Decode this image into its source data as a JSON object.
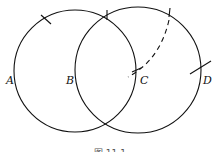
{
  "diagram": {
    "type": "geometric construction",
    "stroke_color": "#111111",
    "circles": [
      {
        "name": "left-circle",
        "cx": 75,
        "cy": 70,
        "r": 61
      },
      {
        "name": "right-circle",
        "cx": 138,
        "cy": 70,
        "r": 63
      }
    ],
    "points": [
      {
        "label": "A",
        "x": 7,
        "y": 83
      },
      {
        "label": "B",
        "x": 66,
        "y": 83
      },
      {
        "label": "C",
        "x": 140,
        "y": 83
      },
      {
        "label": "D",
        "x": 202,
        "y": 83
      }
    ],
    "caption": "图 11.1"
  }
}
